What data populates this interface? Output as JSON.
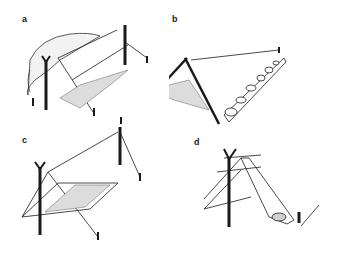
{
  "figure": {
    "panels": [
      {
        "id": "a",
        "label": "a",
        "description": "Tarp A-frame shelter against rock with bedding"
      },
      {
        "id": "b",
        "label": "b",
        "description": "Lean-to with bipod and rocks weighting tarp edge"
      },
      {
        "id": "c",
        "label": "c",
        "description": "A-frame tarp between two poles with ground sheet"
      },
      {
        "id": "d",
        "label": "d",
        "description": "Single pole tarp shelter with stake and rock"
      }
    ],
    "colors": {
      "ink": "#1a1a1a",
      "background": "#ffffff",
      "hatch": "#888888"
    }
  }
}
